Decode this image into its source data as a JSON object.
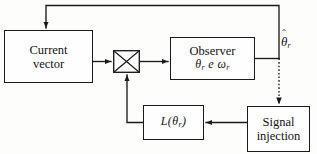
{
  "diagram": {
    "line_color": "#1b1b1b",
    "background_color": "#fdfdfc",
    "blocks": [
      {
        "id": "current-vector",
        "line1": "Current",
        "line2": "vector"
      },
      {
        "id": "observer",
        "line1": "Observer",
        "math_theta": "θ",
        "math_theta_sub": "r",
        "math_e": "e",
        "math_omega": "ω",
        "math_omega_sub": "r"
      },
      {
        "id": "gain",
        "label_L": "L(",
        "label_theta": "θ",
        "label_sub": "r",
        "label_close": ")"
      },
      {
        "id": "signal-injection",
        "line1": "Signal",
        "line2": "injection"
      }
    ],
    "summing_junction": {
      "name": "multiplier-cross",
      "symbol": "✕"
    },
    "output_label": {
      "symbol": "θ",
      "hat": "ˆ",
      "subscript": "r"
    },
    "signals": [
      {
        "name": "current-vector-to-junction",
        "style": "solid"
      },
      {
        "name": "junction-to-observer",
        "style": "solid"
      },
      {
        "name": "observer-output-branch",
        "style": "solid"
      },
      {
        "name": "observer-output-to-current-vector-feedback",
        "style": "solid"
      },
      {
        "name": "observer-output-to-signal-injection",
        "style": "dotted"
      },
      {
        "name": "signal-injection-to-gain",
        "style": "solid"
      },
      {
        "name": "gain-to-junction-feedback",
        "style": "solid"
      }
    ]
  }
}
